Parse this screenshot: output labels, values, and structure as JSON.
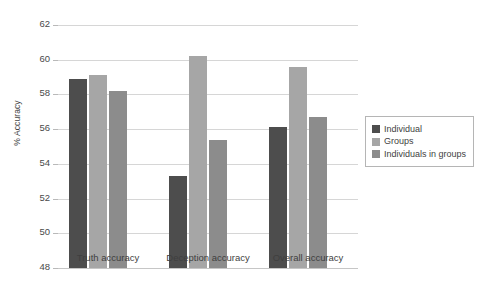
{
  "chart_data": {
    "type": "bar",
    "title": "",
    "xlabel": "",
    "ylabel": "% Accuracy",
    "ylim": [
      48,
      62
    ],
    "yticks": [
      48,
      50,
      52,
      54,
      56,
      58,
      60,
      62
    ],
    "grid": true,
    "legend_position": "right",
    "categories": [
      "Truth accuracy",
      "Deception accuracy",
      "Overall accuracy"
    ],
    "series": [
      {
        "name": "Individual",
        "color": "#4d4d4d",
        "values": [
          58.9,
          53.3,
          56.1
        ]
      },
      {
        "name": "Groups",
        "color": "#a6a6a6",
        "values": [
          59.1,
          60.2,
          59.6
        ]
      },
      {
        "name": "Individuals in groups",
        "color": "#8c8c8c",
        "values": [
          58.2,
          55.35,
          56.7
        ]
      }
    ]
  },
  "axis": {
    "y_title": "% Accuracy",
    "tick_labels": [
      "62",
      "60",
      "58",
      "56",
      "54",
      "52",
      "50",
      "48"
    ]
  },
  "categories": [
    {
      "label": "Truth accuracy"
    },
    {
      "label": "Deception accuracy"
    },
    {
      "label": "Overall accuracy"
    }
  ],
  "legend": {
    "items": [
      {
        "label": "Individual",
        "color": "#4d4d4d"
      },
      {
        "label": "Groups",
        "color": "#a6a6a6"
      },
      {
        "label": "Individuals in groups",
        "color": "#8c8c8c"
      }
    ]
  }
}
